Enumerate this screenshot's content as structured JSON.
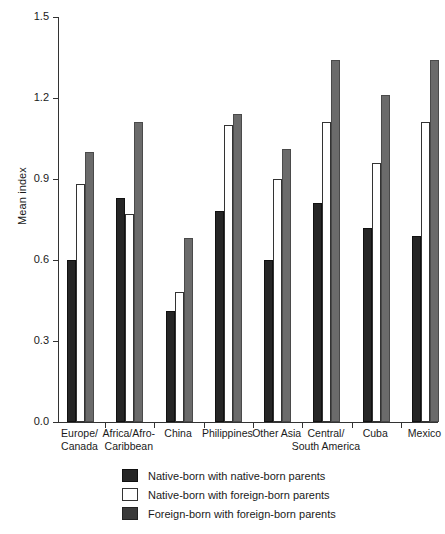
{
  "chart_data": {
    "type": "bar",
    "title": "",
    "xlabel": "",
    "ylabel": "Mean index",
    "ylim": [
      0.0,
      1.5
    ],
    "yticks": [
      "0.0",
      "0.3",
      "0.6",
      "0.9",
      "1.2",
      "1.5"
    ],
    "ytick_values": [
      0.0,
      0.3,
      0.6,
      0.9,
      1.2,
      1.5
    ],
    "grid": false,
    "legend_position": "bottom",
    "categories": [
      "Europe/ Canada",
      "Africa/Afro- Caribbean",
      "China",
      "Philippines",
      "Other Asia",
      "Central/ South America",
      "Cuba",
      "Mexico"
    ],
    "category_lines": [
      [
        "Europe/",
        "Canada"
      ],
      [
        "Africa/Afro-",
        "Caribbean"
      ],
      [
        "China",
        ""
      ],
      [
        "Philippines",
        ""
      ],
      [
        "Other Asia",
        ""
      ],
      [
        "Central/",
        "South America"
      ],
      [
        "Cuba",
        ""
      ],
      [
        "Mexico",
        ""
      ]
    ],
    "series": [
      {
        "name": "Native-born with native-born parents",
        "color": "#262626",
        "values": [
          0.6,
          0.83,
          0.41,
          0.78,
          0.6,
          0.81,
          0.72,
          0.69
        ]
      },
      {
        "name": "Native-born with foreign-born parents",
        "color": "#ffffff",
        "values": [
          0.88,
          0.77,
          0.48,
          1.1,
          0.9,
          1.11,
          0.96,
          1.11
        ]
      },
      {
        "name": "Foreign-born with foreign-born parents",
        "color": "#6b6b6b",
        "values": [
          1.0,
          1.11,
          0.68,
          1.14,
          1.01,
          1.34,
          1.21,
          1.34
        ]
      }
    ]
  },
  "legend": {
    "items": [
      {
        "label": "Native-born with native-born parents",
        "swatch": "native-native"
      },
      {
        "label": "Native-born with foreign-born parents",
        "swatch": "native-foreign"
      },
      {
        "label": "Foreign-born with foreign-born parents",
        "swatch": "foreign-foreign"
      }
    ]
  }
}
